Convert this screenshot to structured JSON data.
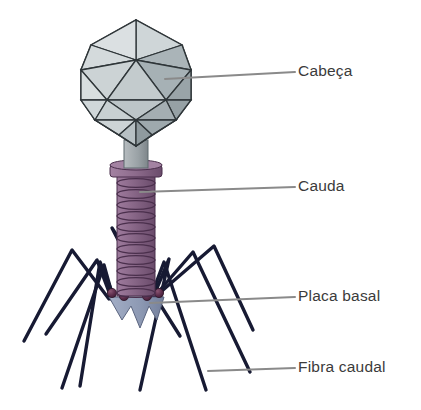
{
  "figure": {
    "language": "pt-BR",
    "background_color": "#ffffff"
  },
  "labels": [
    {
      "id": "cabeca",
      "text": "Cabeça",
      "part": "head-capsid"
    },
    {
      "id": "cauda",
      "text": "Cauda",
      "part": "tail-sheath"
    },
    {
      "id": "placa",
      "text": "Placa basal",
      "part": "base-plate"
    },
    {
      "id": "fibra",
      "text": "Fibra caudal",
      "part": "tail-fiber"
    }
  ],
  "colors": {
    "capsid_light": "#d2d8da",
    "capsid_mid": "#b9c2c5",
    "capsid_dark": "#9aa5a9",
    "capsid_edge": "#2e3538",
    "neck_gray": "#9aa2a6",
    "tail_purple": "#8d6b8c",
    "tail_purple_dark": "#6e4f6f",
    "tail_edge": "#4a2f4c",
    "baseplate_blue": "#8e9ab4",
    "baseplate_edge": "#5b6580",
    "sphere_maroon": "#5a2c4a",
    "fiber_navy": "#171a33",
    "leader_gray": "#8a8a8a",
    "text_gray": "#3b3b3b"
  }
}
